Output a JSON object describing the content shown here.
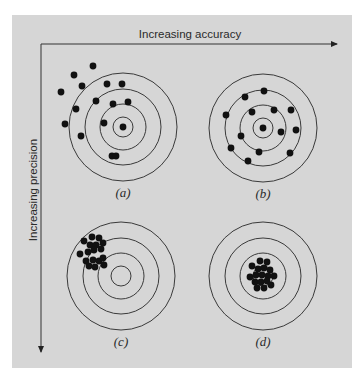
{
  "figure": {
    "x_axis_label": "Increasing accuracy",
    "y_axis_label": "Increasing precision",
    "colors": {
      "background": "#d6d6d6",
      "ink": "#111111",
      "ring": "#3a3a3a"
    },
    "ring_radii": [
      54,
      38,
      23,
      10
    ],
    "targets": [
      {
        "id": "a",
        "label": "(a)",
        "center": [
          123,
          127
        ],
        "description": "inaccurate and imprecise",
        "dots": [
          [
            93,
            66
          ],
          [
            74,
            75
          ],
          [
            82,
            86
          ],
          [
            61,
            92
          ],
          [
            107,
            84
          ],
          [
            122,
            84
          ],
          [
            76,
            109
          ],
          [
            96,
            101
          ],
          [
            113,
            104
          ],
          [
            128,
            102
          ],
          [
            65,
            124
          ],
          [
            104,
            123
          ],
          [
            123,
            127
          ],
          [
            81,
            136
          ],
          [
            112,
            156
          ],
          [
            116,
            156
          ]
        ]
      },
      {
        "id": "b",
        "label": "(b)",
        "center": [
          263,
          128
        ],
        "description": "accurate and imprecise",
        "dots": [
          [
            264,
            91
          ],
          [
            245,
            97
          ],
          [
            226,
            115
          ],
          [
            252,
            112
          ],
          [
            274,
            110
          ],
          [
            291,
            110
          ],
          [
            263,
            128
          ],
          [
            281,
            132
          ],
          [
            296,
            130
          ],
          [
            241,
            136
          ],
          [
            231,
            148
          ],
          [
            259,
            152
          ],
          [
            290,
            153
          ],
          [
            248,
            161
          ]
        ]
      },
      {
        "id": "c",
        "label": "(c)",
        "center": [
          121,
          276
        ],
        "description": "inaccurate and precise",
        "dots": [
          [
            92,
            237
          ],
          [
            99,
            238
          ],
          [
            84,
            241
          ],
          [
            90,
            245
          ],
          [
            96,
            245
          ],
          [
            103,
            243
          ],
          [
            80,
            254
          ],
          [
            88,
            252
          ],
          [
            94,
            250
          ],
          [
            101,
            249
          ],
          [
            86,
            261
          ],
          [
            93,
            260
          ],
          [
            99,
            261
          ],
          [
            103,
            258
          ],
          [
            89,
            266
          ],
          [
            95,
            267
          ],
          [
            104,
            265
          ]
        ]
      },
      {
        "id": "d",
        "label": "(d)",
        "center": [
          263,
          276
        ],
        "description": "accurate and precise",
        "dots": [
          [
            260,
            261
          ],
          [
            267,
            262
          ],
          [
            252,
            266
          ],
          [
            258,
            269
          ],
          [
            264,
            268
          ],
          [
            270,
            270
          ],
          [
            250,
            277
          ],
          [
            256,
            275
          ],
          [
            262,
            275
          ],
          [
            268,
            276
          ],
          [
            274,
            276
          ],
          [
            255,
            282
          ],
          [
            261,
            282
          ],
          [
            267,
            281
          ],
          [
            257,
            288
          ],
          [
            264,
            288
          ],
          [
            271,
            285
          ]
        ]
      }
    ]
  }
}
